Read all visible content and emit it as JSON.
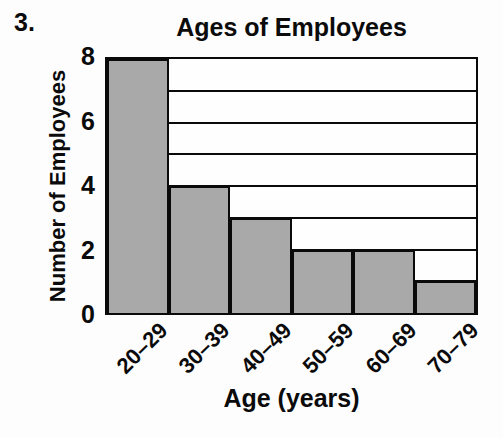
{
  "problem_number": "3.",
  "chart_data": {
    "type": "bar",
    "title": "Ages of Employees",
    "categories": [
      "20–29",
      "30–39",
      "40–49",
      "50–59",
      "60–69",
      "70–79"
    ],
    "values": [
      8,
      4,
      3,
      2,
      2,
      1
    ],
    "xlabel": "Age (years)",
    "ylabel": "Number of Employees",
    "ylim": [
      0,
      8
    ],
    "yticks": [
      0,
      2,
      4,
      6,
      8
    ],
    "gridline_interval": 1,
    "grid": "horizontal",
    "legend_position": "none",
    "bar_fill_color": "#a9a9a9",
    "bar_border_color": "#0a0a0a"
  }
}
